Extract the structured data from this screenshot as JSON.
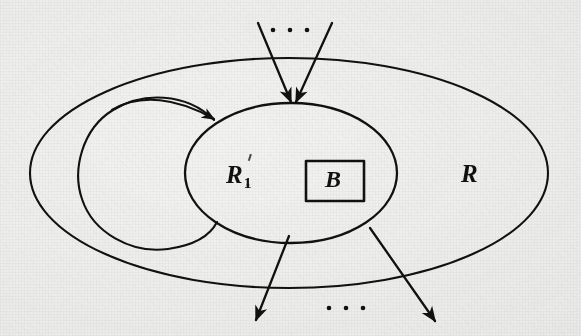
{
  "figure": {
    "type": "set-diagram",
    "background_color": "#f3f3f1",
    "ink_color": "#111111",
    "labels": {
      "outer_set": "R",
      "inner_set_base": "R",
      "inner_set_subscript": "1",
      "box": "B"
    },
    "ellipsis": {
      "top": "· · ·",
      "bottom": "· · ·",
      "dot_count": 3
    },
    "shapes": [
      {
        "name": "outer-ellipse",
        "label": "R",
        "cx": 289,
        "cy": 173,
        "rx": 259,
        "ry": 115
      },
      {
        "name": "inner-ellipse",
        "label": "R1",
        "cx": 291,
        "cy": 173,
        "rx": 106,
        "ry": 70
      },
      {
        "name": "box-b",
        "label": "B",
        "x": 306,
        "y": 161,
        "width": 58,
        "height": 40
      },
      {
        "name": "left-loop",
        "label": "",
        "kind": "open-curve-with-arrow"
      }
    ],
    "arrows": [
      {
        "name": "incoming-arrow-left",
        "from": [
          258,
          23
        ],
        "to": [
          292,
          103
        ],
        "direction": "into-R1"
      },
      {
        "name": "incoming-arrow-right",
        "from": [
          331,
          23
        ],
        "to": [
          295,
          103
        ],
        "direction": "into-R1"
      },
      {
        "name": "outgoing-arrow-left",
        "from": [
          288,
          236
        ],
        "to": [
          256,
          319
        ],
        "direction": "out-of-R1"
      },
      {
        "name": "outgoing-arrow-right",
        "from": [
          371,
          228
        ],
        "to": [
          434,
          320
        ],
        "direction": "out-of-R1"
      },
      {
        "name": "loop-arrow",
        "from": [
          108,
          128
        ],
        "to": [
          218,
          118
        ],
        "direction": "into-R1"
      }
    ]
  }
}
